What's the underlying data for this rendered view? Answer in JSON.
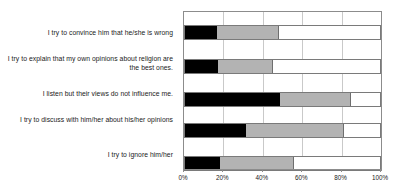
{
  "chart_data": {
    "type": "bar",
    "orientation": "horizontal",
    "stacked": true,
    "stacked_percent": true,
    "title": "",
    "subtitle": "",
    "xlabel": "",
    "ylabel": "",
    "xlim": [
      0,
      100
    ],
    "xtick_labels": [
      "0%",
      "20%",
      "40%",
      "60%",
      "80%",
      "100%"
    ],
    "xtick_values": [
      0,
      20,
      40,
      60,
      80,
      100
    ],
    "grid": true,
    "legend": "none",
    "categories": [
      "I try to convince him that he/she is wrong",
      "I try to explain that my own opinions about religion are the best ones.",
      "I listen but their views do not influence me.",
      "I try to discuss with him/her about his/her opinions",
      "I try to ignore him/her"
    ],
    "series": [
      {
        "name": "series-1",
        "color": "#000000",
        "values": [
          16,
          17,
          48,
          31,
          18
        ]
      },
      {
        "name": "series-2",
        "color": "#b3b3b3",
        "values": [
          31,
          27,
          36,
          49,
          37
        ]
      },
      {
        "name": "series-3",
        "color": "#ffffff",
        "values": [
          53,
          56,
          16,
          20,
          45
        ]
      }
    ],
    "cumulative_boundaries": [
      [
        16,
        47
      ],
      [
        17,
        44
      ],
      [
        48,
        84
      ],
      [
        31,
        80
      ],
      [
        18,
        55
      ]
    ],
    "colors": {
      "segment_1": "#000000",
      "segment_2": "#b3b3b3",
      "segment_3": "#ffffff",
      "plot_border": "#8c8c8c",
      "gridline": "#c9c9c9",
      "bar_outline": "#7a7a7a",
      "text": "#1a1a1a",
      "background": "#ffffff"
    }
  }
}
